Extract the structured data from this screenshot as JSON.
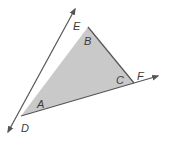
{
  "diagram": {
    "type": "triangle-with-exterior-rays",
    "fill_color": "#c9c9c9",
    "stroke_color": "#555555",
    "vertices": {
      "B": {
        "x": 88,
        "y": 27
      },
      "C": {
        "x": 134,
        "y": 83
      },
      "D": {
        "x": 21,
        "y": 116
      }
    },
    "rays": [
      {
        "from": "D",
        "through": "B",
        "end": {
          "x": 75,
          "y": 9
        },
        "label": "E"
      },
      {
        "from": "D",
        "through": "C",
        "end": {
          "x": 158,
          "y": 76
        },
        "label": "F"
      },
      {
        "from": "B",
        "through": "D",
        "end": {
          "x": 8,
          "y": 132
        },
        "label": "D"
      }
    ],
    "labels": {
      "E": "E",
      "B": "B",
      "C": "C",
      "F": "F",
      "A": "A",
      "D": "D"
    }
  }
}
